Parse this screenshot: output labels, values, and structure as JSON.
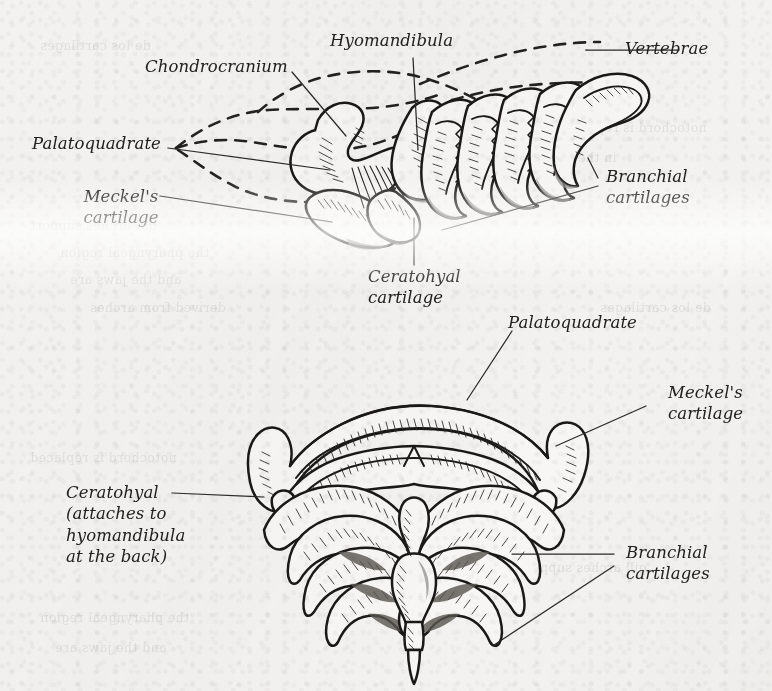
{
  "figure": {
    "views": [
      {
        "name": "lateral-view",
        "position": "top"
      },
      {
        "name": "ventral-view",
        "position": "bottom"
      }
    ]
  },
  "labels": {
    "chondrocranium": {
      "text": "Chondrocranium",
      "view": "lateral"
    },
    "hyomandibula": {
      "text": "Hyomandibula",
      "view": "lateral"
    },
    "vertebrae": {
      "text": "Vertebrae",
      "view": "lateral"
    },
    "palatoquadrate_top": {
      "text": "Palatoquadrate",
      "view": "lateral"
    },
    "meckels_cartilage_top": {
      "text": "Meckel's\ncartilage",
      "view": "lateral"
    },
    "branchial_top": {
      "text": "Branchial\ncartilages",
      "view": "lateral"
    },
    "ceratohyal_top": {
      "text": "Ceratohyal\ncartilage",
      "view": "lateral"
    },
    "palatoquadrate_bottom": {
      "text": "Palatoquadrate",
      "view": "ventral"
    },
    "meckels_cartilage_bot": {
      "text": "Meckel's\ncartilage",
      "view": "ventral"
    },
    "ceratohyal_bottom": {
      "text": "Ceratohyal\n(attaches to\nhyomandibula\nat the back)",
      "view": "ventral"
    },
    "branchial_bottom": {
      "text": "Branchial\ncartilages",
      "view": "ventral"
    }
  },
  "ghost": {
    "g1": "de los cartilages",
    "g2": "notochord is replaced",
    "g3": "in the skull of a shark",
    "g4": "gill arches support",
    "g5": "the pharyngeal region",
    "g6": "and the jaws are",
    "g7": "derived from arches"
  },
  "colors": {
    "paper": "#f3f2f0",
    "ink": "#1b1917",
    "label_text": "#23211f",
    "shading": "#8d8a86",
    "ghost_text": "#b9b6b2"
  }
}
